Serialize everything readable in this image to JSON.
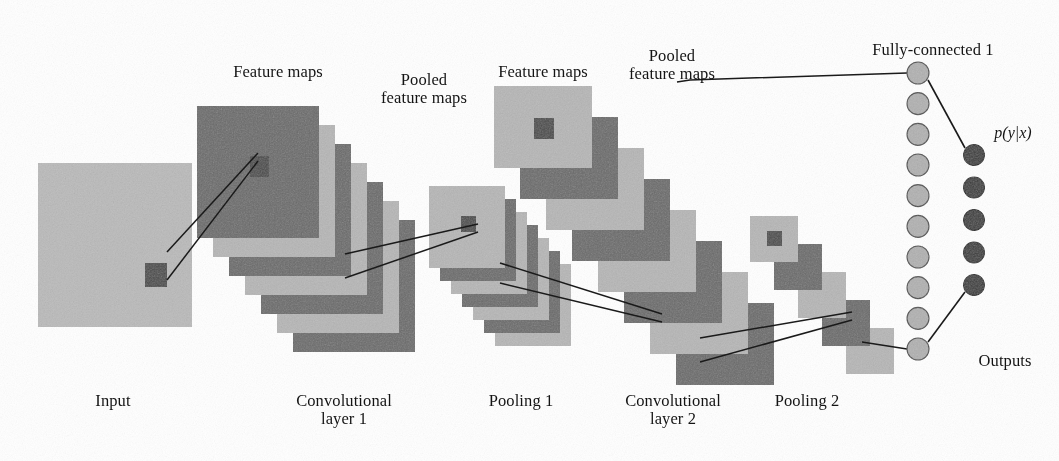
{
  "figure": {
    "background": "#ffffff"
  },
  "palette": {
    "light_gray": "#b9b9b9",
    "dark_gray": "#6c6c6c",
    "input_gray": "#bdbdbd",
    "patch_dark": "#4a4a4a",
    "node_light": "#b4b4b4",
    "node_dark": "#3a3a3a",
    "stroke": "#1a1a1a"
  },
  "top_labels": [
    {
      "id": "feature-maps-1",
      "text": "Feature maps",
      "x": 278,
      "y": 63
    },
    {
      "id": "pooled-feature-maps-1",
      "text": "Pooled\nfeature maps",
      "x": 424,
      "y": 71
    },
    {
      "id": "feature-maps-2",
      "text": "Feature maps",
      "x": 543,
      "y": 63
    },
    {
      "id": "pooled-feature-maps-2",
      "text": "Pooled\nfeature maps",
      "x": 672,
      "y": 47
    },
    {
      "id": "fully-connected-1",
      "text": "Fully-connected 1",
      "x": 933,
      "y": 41
    }
  ],
  "bottom_labels": [
    {
      "id": "input",
      "text": "Input",
      "x": 113,
      "y": 392
    },
    {
      "id": "convolutional-layer-1",
      "text": "Convolutional\nlayer 1",
      "x": 344,
      "y": 392
    },
    {
      "id": "pooling-1",
      "text": "Pooling 1",
      "x": 521,
      "y": 392
    },
    {
      "id": "convolutional-layer-2",
      "text": "Convolutional\nlayer 2",
      "x": 673,
      "y": 392
    },
    {
      "id": "pooling-2",
      "text": "Pooling 2",
      "x": 807,
      "y": 392
    }
  ],
  "side_labels": [
    {
      "id": "probability-output",
      "text": "p(y|x)",
      "x": 1013,
      "y": 124,
      "italic": true
    },
    {
      "id": "outputs",
      "text": "Outputs",
      "x": 1005,
      "y": 352
    }
  ],
  "input_layer": {
    "name": "input-image",
    "x": 38,
    "y": 163,
    "w": 154,
    "h": 164,
    "color": "#bdbdbd",
    "receptive_patch": {
      "x": 145,
      "y": 263,
      "w": 22,
      "h": 24,
      "color": "#4a4a4a"
    }
  },
  "stacks": [
    {
      "id": "conv-layer-1",
      "count": 7,
      "w": 122,
      "h": 132,
      "origin_x": 197,
      "origin_y": 106,
      "step_x": 16,
      "step_y": 19,
      "colors": [
        "#6c6c6c",
        "#b9b9b9"
      ],
      "front_patch": {
        "dx": 53,
        "dy": 50,
        "w": 19,
        "h": 21,
        "color": "#4a4a4a"
      }
    },
    {
      "id": "pooling-1",
      "count": 7,
      "w": 76,
      "h": 82,
      "origin_x": 429,
      "origin_y": 186,
      "step_x": 11,
      "step_y": 13,
      "colors": [
        "#b9b9b9",
        "#6c6c6c"
      ],
      "front_patch": {
        "dx": 32,
        "dy": 30,
        "w": 15,
        "h": 16,
        "color": "#4a4a4a"
      }
    },
    {
      "id": "conv-layer-2",
      "count": 8,
      "w": 98,
      "h": 82,
      "origin_x": 494,
      "origin_y": 86,
      "step_x": 26,
      "step_y": 31,
      "colors": [
        "#b9b9b9",
        "#6c6c6c"
      ],
      "front_patch": {
        "dx": 40,
        "dy": 32,
        "w": 20,
        "h": 21,
        "color": "#4a4a4a"
      }
    },
    {
      "id": "pooling-2",
      "count": 5,
      "w": 48,
      "h": 46,
      "origin_x": 750,
      "origin_y": 216,
      "step_x": 24,
      "step_y": 28,
      "colors": [
        "#b9b9b9",
        "#6c6c6c"
      ],
      "front_patch": {
        "dx": 17,
        "dy": 15,
        "w": 15,
        "h": 15,
        "color": "#4a4a4a"
      }
    }
  ],
  "fully_connected": {
    "name": "fully-connected-layer-1",
    "node_count": 10,
    "cx": 918,
    "y_first": 73,
    "y_last": 349,
    "r": 11,
    "fill": "#b4b4b4",
    "stroke": "#4c4c4c"
  },
  "outputs": {
    "name": "output-layer",
    "node_count": 5,
    "cx": 974,
    "y_first": 155,
    "y_last": 285,
    "r": 10.5,
    "fill": "#3a3a3a",
    "stroke": "#222222"
  },
  "connectors": {
    "receptive_cones": [
      {
        "id": "input-to-conv1",
        "from_x": 167,
        "from_y": 266,
        "to_x": 258,
        "to_y": 157,
        "spread_from": 14,
        "spread_to": 4
      },
      {
        "id": "conv1-to-pool1",
        "from_x": 345,
        "from_y": 266,
        "to_x": 478,
        "to_y": 228,
        "spread_from": 12,
        "spread_to": 4
      },
      {
        "id": "pool1-to-conv2",
        "from_x": 500,
        "from_y": 273,
        "to_x": 662,
        "to_y": 318,
        "spread_from": 10,
        "spread_to": 4
      },
      {
        "id": "conv2-to-pool2",
        "from_x": 700,
        "from_y": 350,
        "to_x": 852,
        "to_y": 316,
        "spread_from": 12,
        "spread_to": 4
      }
    ],
    "flatten_lines": [
      {
        "id": "pool2-top-to-fc-first",
        "points": "677,82 690,80 907,73"
      },
      {
        "id": "pool2-bottom-to-fc-last",
        "points": "862,342 907,349"
      }
    ],
    "fc_to_output_lines": [
      {
        "id": "fc-first-to-output-first",
        "points": "928,80 965,148"
      },
      {
        "id": "fc-last-to-output-last",
        "points": "928,342 965,292"
      }
    ]
  }
}
